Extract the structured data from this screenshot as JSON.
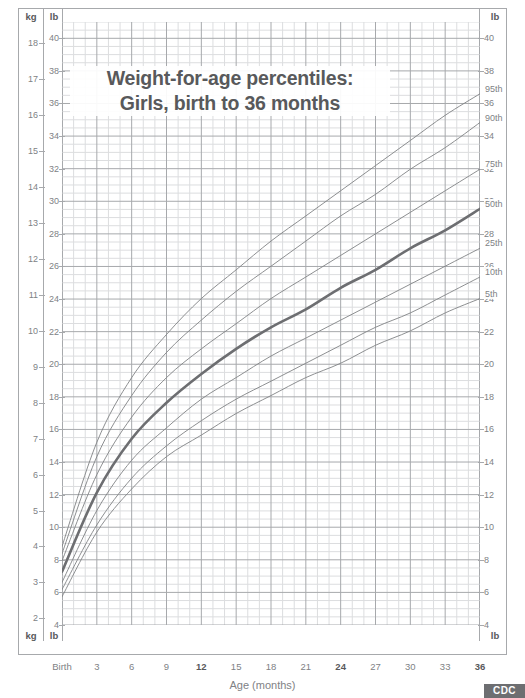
{
  "chart_data": {
    "type": "line",
    "title": "Weight-for-age percentiles:",
    "subtitle": "Girls, birth to 36 months",
    "xlabel": "Age (months)",
    "ylabel_left_primary": "kg",
    "ylabel_left_secondary": "lb",
    "ylabel_right": "lb",
    "grid": true,
    "legend_position": "inline-right",
    "x": [
      0,
      3,
      6,
      9,
      12,
      15,
      18,
      21,
      24,
      27,
      30,
      33,
      36
    ],
    "xtick_labels": [
      "Birth",
      "3",
      "6",
      "9",
      "12",
      "15",
      "18",
      "21",
      "24",
      "27",
      "30",
      "33",
      "36"
    ],
    "xtick_bold": [
      false,
      false,
      false,
      false,
      true,
      false,
      false,
      false,
      true,
      false,
      false,
      false,
      true
    ],
    "xlim_months": [
      0,
      36
    ],
    "ylim_lb": [
      4,
      41
    ],
    "ylim_kg": [
      1.814,
      18.6
    ],
    "ytick_lb": [
      4,
      6,
      8,
      10,
      12,
      14,
      16,
      18,
      20,
      22,
      24,
      26,
      28,
      30,
      32,
      34,
      36,
      38,
      40
    ],
    "ytick_kg": [
      2,
      3,
      4,
      5,
      6,
      7,
      8,
      9,
      10,
      11,
      12,
      13,
      14,
      15,
      16,
      17,
      18
    ],
    "series": [
      {
        "name": "95th",
        "label": "95th",
        "values_kg": [
          4.0,
          6.9,
          8.7,
          9.9,
          10.9,
          11.7,
          12.5,
          13.2,
          13.9,
          14.6,
          15.3,
          16.0,
          16.6
        ]
      },
      {
        "name": "90th",
        "label": "90th",
        "values_kg": [
          3.8,
          6.5,
          8.2,
          9.4,
          10.3,
          11.1,
          11.8,
          12.5,
          13.2,
          13.8,
          14.5,
          15.1,
          15.8
        ]
      },
      {
        "name": "75th",
        "label": "75th",
        "values_kg": [
          3.6,
          6.0,
          7.6,
          8.7,
          9.5,
          10.2,
          10.9,
          11.5,
          12.1,
          12.7,
          13.3,
          13.9,
          14.5
        ]
      },
      {
        "name": "50th",
        "label": "50th",
        "values_kg": [
          3.3,
          5.5,
          7.0,
          8.0,
          8.8,
          9.5,
          10.1,
          10.6,
          11.2,
          11.7,
          12.3,
          12.8,
          13.4
        ]
      },
      {
        "name": "25th",
        "label": "25th",
        "values_kg": [
          3.0,
          5.0,
          6.4,
          7.3,
          8.1,
          8.7,
          9.3,
          9.8,
          10.3,
          10.8,
          11.3,
          11.8,
          12.3
        ]
      },
      {
        "name": "10th",
        "label": "10th",
        "values_kg": [
          2.8,
          4.6,
          5.9,
          6.8,
          7.5,
          8.1,
          8.6,
          9.1,
          9.6,
          10.1,
          10.5,
          11.0,
          11.5
        ]
      },
      {
        "name": "5th",
        "label": "5th",
        "values_kg": [
          2.6,
          4.4,
          5.6,
          6.5,
          7.1,
          7.7,
          8.2,
          8.7,
          9.1,
          9.6,
          10.0,
          10.5,
          10.9
        ]
      }
    ],
    "emphasized_series": "50th",
    "colors": {
      "curve": "#808285",
      "curve_emphasized": "#6d6e71",
      "grid_major": "#a7a9ac",
      "grid_minor": "#dcdddf",
      "text": "#58595b",
      "tick_text": "#808285",
      "frame": "#a7a9ac"
    }
  },
  "axes": {
    "left_unit_top_kg": "kg",
    "left_unit_top_lb": "lb",
    "left_unit_bottom_kg": "kg",
    "left_unit_bottom_lb": "lb",
    "right_unit_top_lb": "lb",
    "right_unit_bottom_lb": "lb"
  },
  "footer": {
    "logo_text": "CDC"
  }
}
